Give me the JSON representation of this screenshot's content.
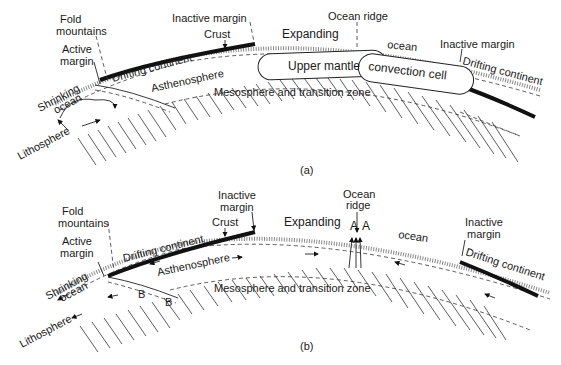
{
  "figure": {
    "panels": [
      {
        "id": "a",
        "caption": "(a)",
        "labels": {
          "fold_mountains_1": "Fold",
          "fold_mountains_2": "mountains",
          "active_margin_1": "Active",
          "active_margin_2": "margin",
          "inactive_margin_left": "Inactive margin",
          "crust": "Crust",
          "ocean_ridge": "Ocean ridge",
          "expanding": "Expanding",
          "ocean": "ocean",
          "inactive_margin_right": "Inactive margin",
          "drifting_continent_left": "Drifting continent",
          "drifting_continent_right": "Drifting continent",
          "shrinking": "Shrinking",
          "shrinking_ocean": "ocean",
          "asthenosphere": "Asthenosphere",
          "upper_mantle": "Upper mantle",
          "convection_cell": "convection cell",
          "mesosphere": "Mesosphere and transition zone",
          "lithosphere": "Lithosphere"
        }
      },
      {
        "id": "b",
        "caption": "(b)",
        "labels": {
          "fold_mountains_1": "Fold",
          "fold_mountains_2": "mountains",
          "active_margin_1": "Active",
          "active_margin_2": "margin",
          "inactive_margin_left_1": "Inactive",
          "inactive_margin_left_2": "margin",
          "crust": "Crust",
          "ocean_ridge_1": "Ocean",
          "ocean_ridge_2": "ridge",
          "expanding": "Expanding",
          "ridge_a_left": "A",
          "ridge_a_right": "A",
          "ocean": "ocean",
          "inactive_margin_right_1": "Inactive",
          "inactive_margin_right_2": "margin",
          "drifting_continent_left": "Drifting continent",
          "drifting_continent_right": "Drifting continent",
          "shrinking": "Shrinking",
          "shrinking_ocean": "ocean",
          "asthenosphere": "Asthenosphere",
          "slab_b_1": "B",
          "slab_b_2": "B",
          "mesosphere": "Mesosphere and transition zone",
          "lithosphere": "Lithosphere"
        }
      }
    ]
  }
}
